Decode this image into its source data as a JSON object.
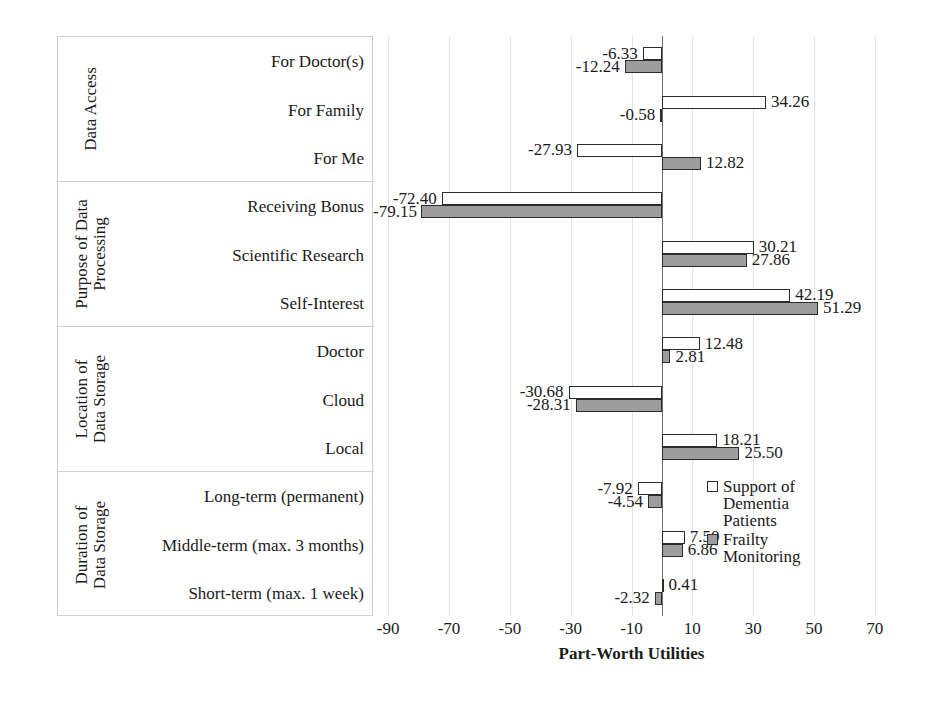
{
  "chart_data": {
    "type": "bar",
    "orientation": "horizontal",
    "title": "",
    "xlabel": "Part-Worth Utilities",
    "ylabel": "",
    "xlim": [
      -95,
      75
    ],
    "xticks": [
      -90,
      -70,
      -50,
      -30,
      -10,
      10,
      30,
      50,
      70
    ],
    "grid": "vertical",
    "legend_position": "right-inside",
    "categories": [
      "For Doctor(s)",
      "For Family",
      "For Me",
      "Receiving Bonus",
      "Scientific Research",
      "Self-Interest",
      "Doctor",
      "Cloud",
      "Local",
      "Long-term (permanent)",
      "Middle-term (max. 3 months)",
      "Short-term (max. 1 week)"
    ],
    "series": [
      {
        "name": "Support of Dementia Patients",
        "color": "#ffffff",
        "values": [
          -6.33,
          34.26,
          -27.93,
          -72.4,
          30.21,
          42.19,
          12.48,
          -30.68,
          18.21,
          -7.92,
          7.5,
          0.41
        ]
      },
      {
        "name": "Frailty Monitoring",
        "color": "#9d9d9d",
        "values": [
          -12.24,
          -0.58,
          12.82,
          -79.15,
          27.86,
          51.29,
          2.81,
          -28.31,
          25.5,
          -4.54,
          6.86,
          -2.32
        ]
      }
    ],
    "groups": [
      {
        "title": "Data Access",
        "rows": 3
      },
      {
        "title": "Purpose of Data Processing",
        "rows": 3
      },
      {
        "title": "Location of Data Storage",
        "rows": 3
      },
      {
        "title": "Duration of Data Storage",
        "rows": 3
      }
    ]
  },
  "legend": {
    "items": [
      {
        "label_line1": "Support of",
        "label_line2": "Dementia",
        "label_line3": "Patients",
        "swatch": "hollow-square-icon"
      },
      {
        "label_line1": "Frailty",
        "label_line2": "Monitoring",
        "label_line3": "",
        "swatch": "filled-square-icon"
      }
    ]
  },
  "axis": {
    "title": "Part-Worth Utilities",
    "tick_labels": [
      "-90",
      "-70",
      "-50",
      "-30",
      "-10",
      "10",
      "30",
      "50",
      "70"
    ]
  },
  "groups": [
    {
      "title_line1": "Data Access",
      "title_line2": ""
    },
    {
      "title_line1": "Purpose of Data",
      "title_line2": "Processing"
    },
    {
      "title_line1": "Location of",
      "title_line2": "Data Storage"
    },
    {
      "title_line1": "Duration of",
      "title_line2": "Data Storage"
    }
  ],
  "row_labels": [
    "For Doctor(s)",
    "For Family",
    "For Me",
    "Receiving Bonus",
    "Scientific Research",
    "Self-Interest",
    "Doctor",
    "Cloud",
    "Local",
    "Long-term (permanent)",
    "Middle-term (max. 3 months)",
    "Short-term (max. 1 week)"
  ],
  "value_labels": {
    "series0": [
      "-6.33",
      "34.26",
      "-27.93",
      "-72.40",
      "30.21",
      "42.19",
      "12.48",
      "-30.68",
      "18.21",
      "-7.92",
      "7.50",
      "0.41"
    ],
    "series1": [
      "-12.24",
      "-0.58",
      "12.82",
      "-79.15",
      "27.86",
      "51.29",
      "2.81",
      "-28.31",
      "25.50",
      "-4.54",
      "6.86",
      "-2.32"
    ]
  }
}
